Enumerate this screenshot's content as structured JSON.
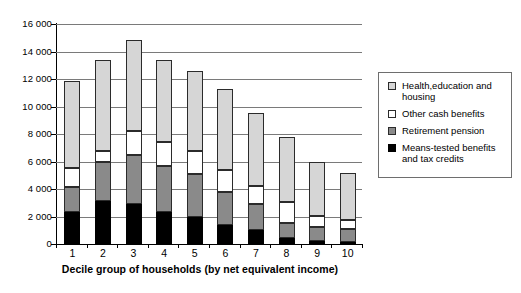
{
  "chart_data": {
    "type": "bar",
    "stacked": true,
    "title": "",
    "xlabel": "Decile group of households (by net equivalent income)",
    "ylabel": "",
    "categories": [
      "1",
      "2",
      "3",
      "4",
      "5",
      "6",
      "7",
      "8",
      "9",
      "10"
    ],
    "ylim": [
      0,
      16000
    ],
    "yticks": [
      0,
      2000,
      4000,
      6000,
      8000,
      10000,
      12000,
      14000,
      16000
    ],
    "ytick_labels": [
      "0",
      "2 000",
      "4 000",
      "6 000",
      "8 000",
      "10 000",
      "12 000",
      "14 000",
      "16 000"
    ],
    "grid": true,
    "legend_position": "right",
    "series": [
      {
        "name": "Means-tested benefits and tax credits",
        "color": "#000000",
        "values": [
          2300,
          3100,
          2900,
          2350,
          2000,
          1350,
          1000,
          450,
          200,
          150
        ]
      },
      {
        "name": "Retirement pension",
        "color": "#8a8a8a",
        "values": [
          1850,
          2850,
          3550,
          3350,
          3100,
          2400,
          1900,
          1100,
          1050,
          950
        ]
      },
      {
        "name": "Other cash benefits",
        "color": "#ffffff",
        "values": [
          1400,
          850,
          1750,
          1750,
          1650,
          1600,
          1300,
          1500,
          800,
          650
        ]
      },
      {
        "name": "Health,education and housing",
        "color": "#d6d6d6",
        "values": [
          6300,
          6600,
          6650,
          5950,
          5800,
          5950,
          5350,
          4750,
          3950,
          3450
        ]
      }
    ],
    "totals": [
      11850,
      13400,
      14850,
      13400,
      12550,
      11300,
      9550,
      7800,
      6000,
      5200
    ]
  },
  "legend": {
    "items": [
      {
        "label": "Health,education and\nhousing",
        "swatch": "c-health"
      },
      {
        "label": "Other cash benefits",
        "swatch": "c-other"
      },
      {
        "label": "Retirement pension",
        "swatch": "c-pension"
      },
      {
        "label": "Means-tested benefits\nand tax credits",
        "swatch": "c-means"
      }
    ]
  }
}
